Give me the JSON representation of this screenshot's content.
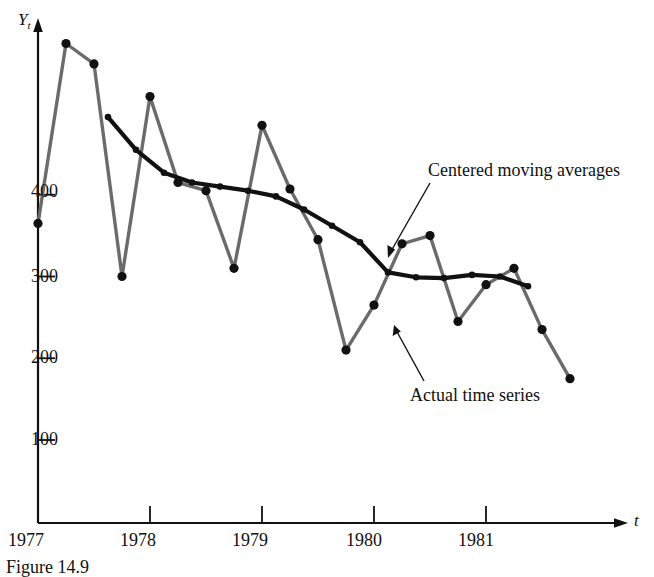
{
  "figure": {
    "caption": "Figure 14.9",
    "y_axis_title": "Y",
    "y_axis_title_sub": "t",
    "x_axis_title": "t"
  },
  "annotations": {
    "moving_average_label": "Centered moving averages",
    "actual_series_label": "Actual time series"
  },
  "colors": {
    "actual_series": "#6b6b6b",
    "moving_average": "#111111",
    "axis": "#111111",
    "marker": "#111111",
    "background": "#ffffff"
  },
  "chart_data": {
    "type": "line",
    "title": "",
    "subtitle": "",
    "xlabel": "t",
    "ylabel": "Y_t",
    "xlim": [
      1977.0,
      1982.0
    ],
    "ylim": [
      0,
      620
    ],
    "grid": false,
    "legend": "annotations-with-leader-lines",
    "yticks": [
      100,
      200,
      300,
      400
    ],
    "ytick_labels": [
      "100",
      "200",
      "300",
      "400"
    ],
    "xticks": [
      1977,
      1978,
      1979,
      1980,
      1981
    ],
    "xtick_labels": [
      "1977",
      "1978",
      "1979",
      "1980",
      "1981"
    ],
    "x_note": "quarterly observations; 1977 tick = 1977 Q1",
    "series": [
      {
        "name": "Actual time series",
        "color": "#6b6b6b",
        "markers": true,
        "x": [
          1977.0,
          1977.25,
          1977.5,
          1977.75,
          1978.0,
          1978.25,
          1978.5,
          1978.75,
          1979.0,
          1979.25,
          1979.5,
          1979.75,
          1980.0,
          1980.25,
          1980.5,
          1980.75,
          1981.0,
          1981.25,
          1981.5,
          1981.75
        ],
        "values": [
          365,
          585,
          560,
          300,
          520,
          415,
          405,
          310,
          485,
          407,
          345,
          210,
          265,
          340,
          350,
          245,
          290,
          310,
          235,
          175
        ]
      },
      {
        "name": "Centered moving averages",
        "color": "#111111",
        "markers": true,
        "x": [
          1977.625,
          1977.875,
          1978.125,
          1978.375,
          1978.625,
          1978.875,
          1979.125,
          1979.375,
          1979.625,
          1979.875,
          1980.125,
          1980.375,
          1980.625,
          1980.875,
          1981.125,
          1981.375
        ],
        "values": [
          495,
          455,
          427,
          415,
          410,
          405,
          398,
          382,
          362,
          342,
          305,
          299,
          298,
          302,
          300,
          288
        ]
      }
    ]
  }
}
